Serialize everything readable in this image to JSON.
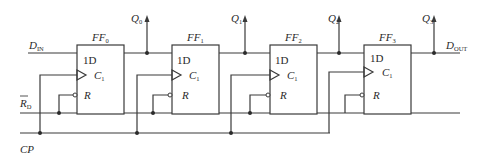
{
  "diagram": {
    "type": "4-bit shift register (D flip-flops)",
    "inputs": {
      "data_in": {
        "main": "D",
        "sub": "IN"
      },
      "reset": {
        "main": "R",
        "sub": "D",
        "overbar": true
      },
      "clock": {
        "main": "CP"
      }
    },
    "output": {
      "main": "D",
      "sub": "OUT"
    },
    "flip_flops": [
      {
        "name": "FF",
        "index": "0",
        "d_label": "1D",
        "c_main": "C",
        "c_sub": "1",
        "r_label": "R",
        "q_main": "Q",
        "q_sub": "0"
      },
      {
        "name": "FF",
        "index": "1",
        "d_label": "1D",
        "c_main": "C",
        "c_sub": "1",
        "r_label": "R",
        "q_main": "Q",
        "q_sub": "1"
      },
      {
        "name": "FF",
        "index": "2",
        "d_label": "1D",
        "c_main": "C",
        "c_sub": "1",
        "r_label": "R",
        "q_main": "Q",
        "q_sub": "2"
      },
      {
        "name": "FF",
        "index": "3",
        "d_label": "1D",
        "c_main": "C",
        "c_sub": "1",
        "r_label": "R",
        "q_main": "Q",
        "q_sub": "3"
      }
    ],
    "colors": {
      "line": "#3a3a3a",
      "text": "#2a2a2a",
      "background": "#ffffff"
    }
  }
}
